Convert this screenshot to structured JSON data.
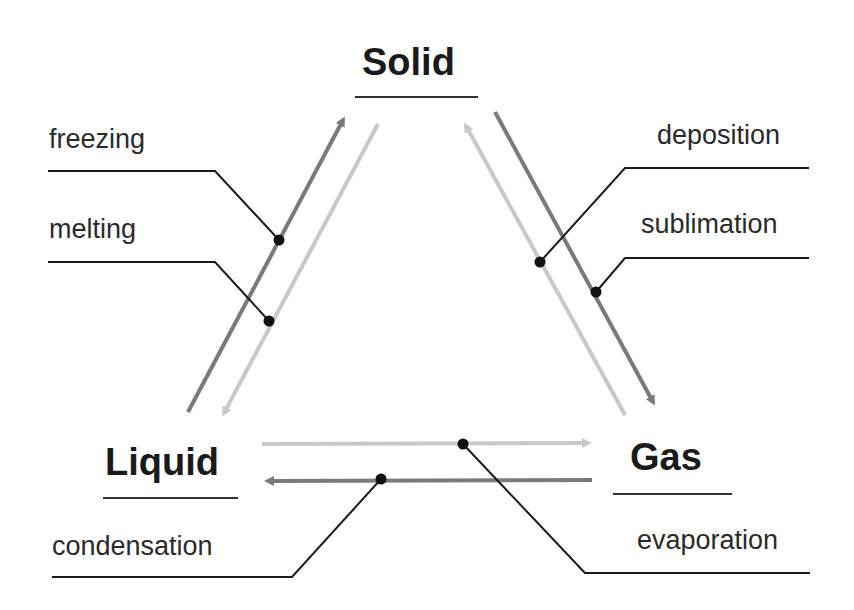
{
  "states": {
    "solid": "Solid",
    "liquid": "Liquid",
    "gas": "Gas"
  },
  "processes": {
    "freezing": {
      "label": "freezing",
      "from": "Liquid",
      "to": "Solid",
      "arrow_shade": "dark"
    },
    "melting": {
      "label": "melting",
      "from": "Solid",
      "to": "Liquid",
      "arrow_shade": "light"
    },
    "deposition": {
      "label": "deposition",
      "from": "Gas",
      "to": "Solid",
      "arrow_shade": "light"
    },
    "sublimation": {
      "label": "sublimation",
      "from": "Solid",
      "to": "Gas",
      "arrow_shade": "dark"
    },
    "evaporation": {
      "label": "evaporation",
      "from": "Liquid",
      "to": "Gas",
      "arrow_shade": "light"
    },
    "condensation": {
      "label": "condensation",
      "from": "Gas",
      "to": "Liquid",
      "arrow_shade": "dark"
    }
  },
  "colors": {
    "dark_arrow": "#7a7a7a",
    "light_arrow": "#c8c8c8",
    "leader_line": "#1a1a1a",
    "text": "#1a1a1a"
  }
}
